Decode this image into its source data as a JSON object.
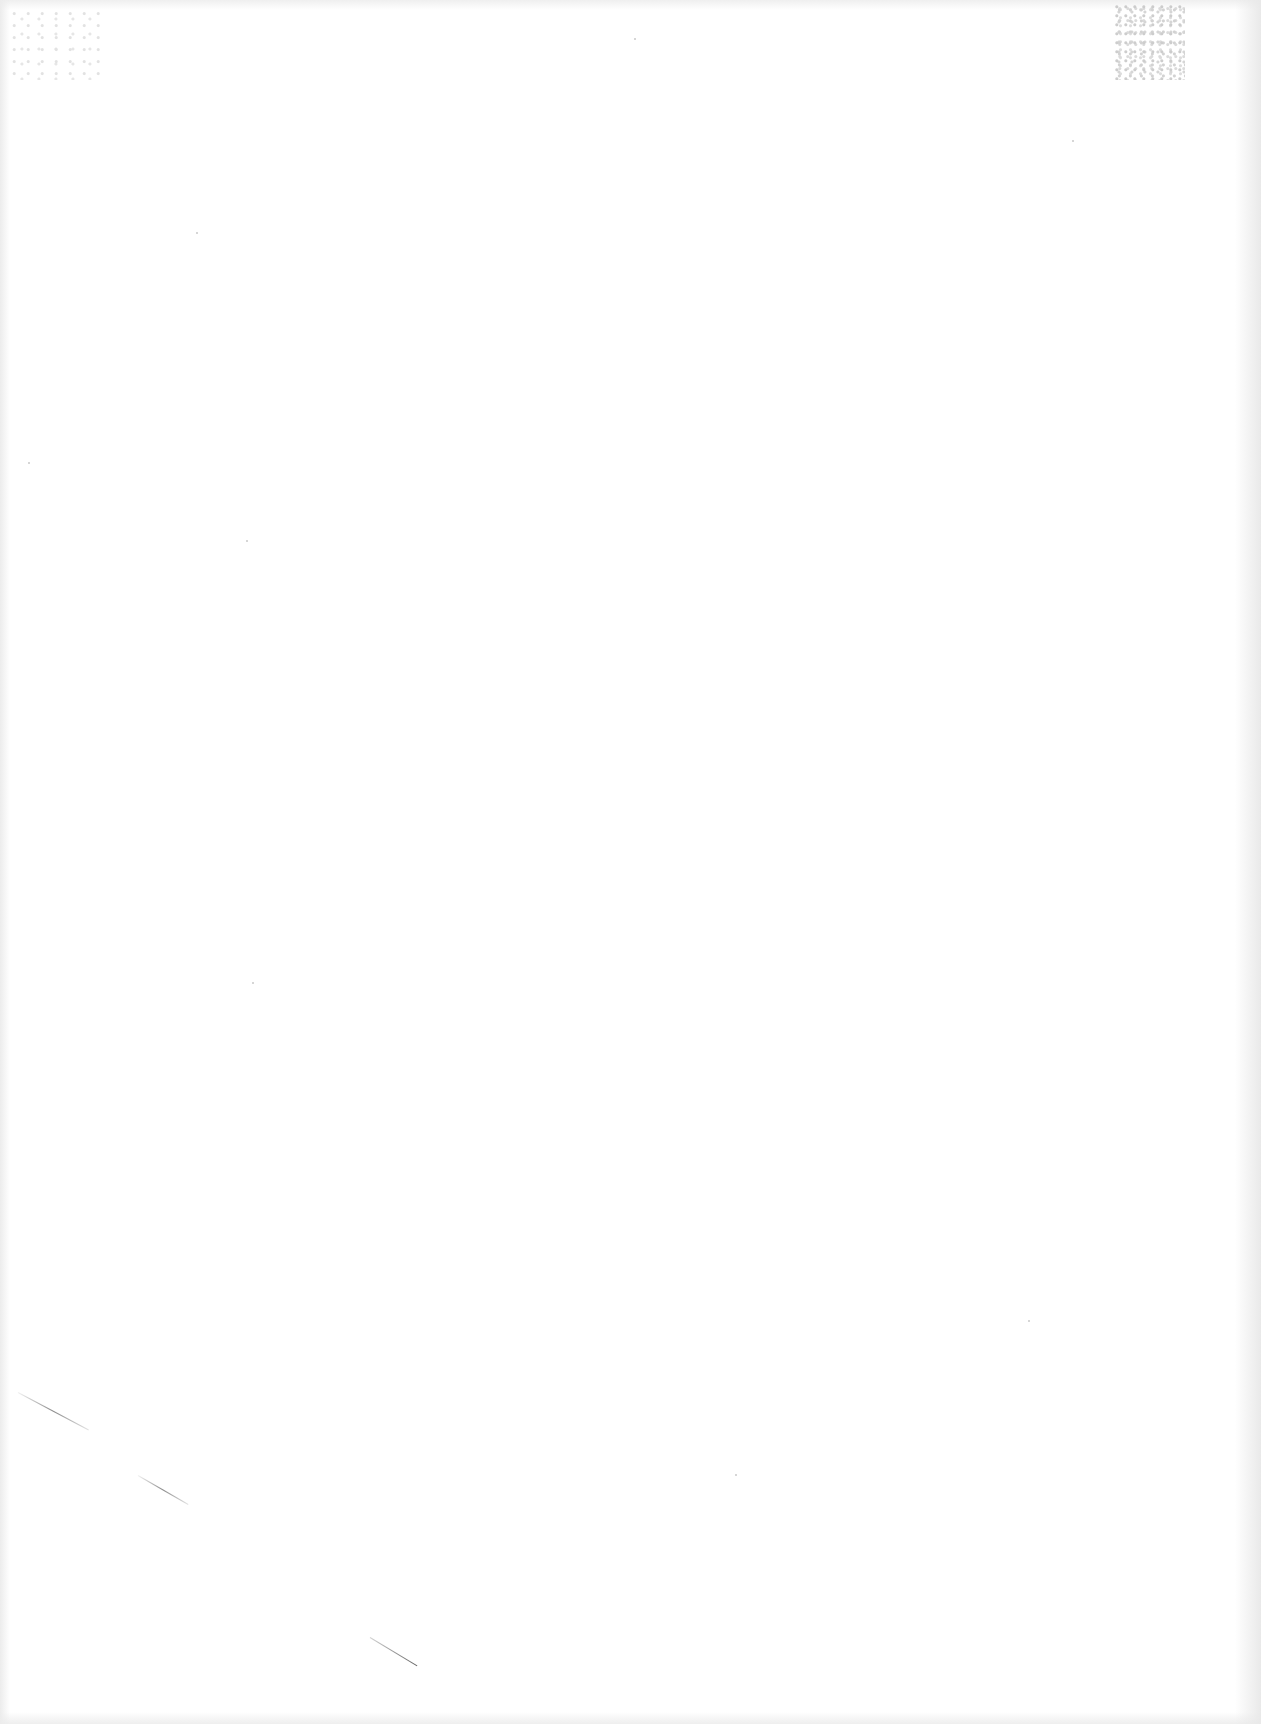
{
  "document": {
    "type": "blank-scanned-page",
    "text_content": [],
    "background_color": "#ffffff",
    "artifacts": {
      "speckle_patch_color": "#bdbdbd",
      "stroke_color": "#5a5a5a"
    }
  }
}
